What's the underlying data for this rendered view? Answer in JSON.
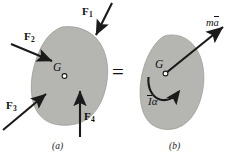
{
  "figure": {
    "type": "free-body-diagram-equivalence",
    "equals_sign": "=",
    "body_fill_color": "#b5b5b2",
    "body_stroke_color": "#8f8f8c",
    "arrow_color": "#1a1a1a",
    "text_color": "#111111"
  },
  "panel_a": {
    "caption": "(a)",
    "center_of_mass_label": "G",
    "forces": [
      {
        "name": "F1",
        "base_label": "F",
        "subscript": "1"
      },
      {
        "name": "F2",
        "base_label": "F",
        "subscript": "2"
      },
      {
        "name": "F3",
        "base_label": "F",
        "subscript": "3"
      },
      {
        "name": "F4",
        "base_label": "F",
        "subscript": "4"
      }
    ]
  },
  "panel_b": {
    "caption": "(b)",
    "center_of_mass_label": "G",
    "resultant_force_label": {
      "prefix": "m",
      "vector": "a",
      "full": "ma"
    },
    "moment_label": {
      "bar_symbol": "I",
      "symbol": "α",
      "full": "Iα"
    }
  }
}
